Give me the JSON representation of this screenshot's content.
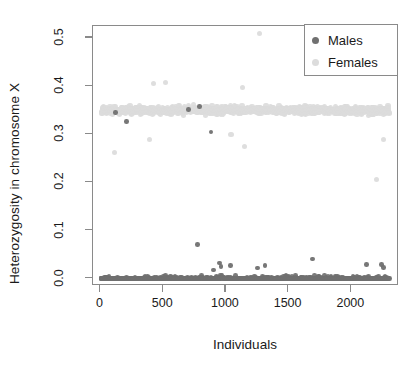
{
  "chart_data": {
    "type": "scatter",
    "title": "",
    "xlabel": "Individuals",
    "ylabel": "Heterozygosity in chromosome X",
    "xlim": [
      -60,
      2380
    ],
    "ylim": [
      -0.015,
      0.525
    ],
    "xticks": [
      0,
      500,
      1000,
      1500,
      2000
    ],
    "xticklabels": [
      "0",
      "500",
      "1000",
      "1500",
      "2000"
    ],
    "yticks": [
      0.0,
      0.1,
      0.2,
      0.3,
      0.4,
      0.5
    ],
    "yticklabels": [
      "0.0",
      "0.1",
      "0.2",
      "0.3",
      "0.4",
      "0.5"
    ],
    "grid": false,
    "legend_position": "top-right",
    "series": [
      {
        "name": "Males",
        "color": "#707070",
        "marker": "circle",
        "marker_size": 4.6,
        "description": "Dense band of ~1150 points hugging y=0.00-0.01 across all individuals, with scattered outliers up to 0.07 and a handful of points inside the female band near 0.30-0.35",
        "n_points": 1150,
        "y_band": [
          0.0,
          0.012
        ],
        "outliers": [
          {
            "x": 205,
            "y": 0.327
          },
          {
            "x": 120,
            "y": 0.345
          },
          {
            "x": 700,
            "y": 0.352
          },
          {
            "x": 790,
            "y": 0.358
          },
          {
            "x": 880,
            "y": 0.305
          },
          {
            "x": 775,
            "y": 0.071
          },
          {
            "x": 950,
            "y": 0.033
          },
          {
            "x": 960,
            "y": 0.025
          },
          {
            "x": 1035,
            "y": 0.028
          },
          {
            "x": 900,
            "y": 0.018
          },
          {
            "x": 1250,
            "y": 0.022
          },
          {
            "x": 1310,
            "y": 0.028
          },
          {
            "x": 1690,
            "y": 0.041
          },
          {
            "x": 2120,
            "y": 0.03
          },
          {
            "x": 2240,
            "y": 0.03
          },
          {
            "x": 2255,
            "y": 0.023
          }
        ]
      },
      {
        "name": "Females",
        "color": "#dcdcdc",
        "marker": "circle",
        "marker_size": 5.2,
        "description": "Dense horizontal band of ~1150 points centred on y=0.35 spanning roughly 0.31-0.39 across all individuals, with low outliers near 0.21-0.29 and one high outlier at 0.51",
        "n_points": 1150,
        "y_band": [
          0.312,
          0.388
        ],
        "y_center": 0.35,
        "outliers": [
          {
            "x": 1270,
            "y": 0.51
          },
          {
            "x": 420,
            "y": 0.405
          },
          {
            "x": 520,
            "y": 0.408
          },
          {
            "x": 1130,
            "y": 0.398
          },
          {
            "x": 110,
            "y": 0.262
          },
          {
            "x": 390,
            "y": 0.29
          },
          {
            "x": 1150,
            "y": 0.275
          },
          {
            "x": 2255,
            "y": 0.29
          },
          {
            "x": 2200,
            "y": 0.207
          },
          {
            "x": 1040,
            "y": 0.3
          }
        ]
      }
    ]
  },
  "legend": {
    "entries": [
      {
        "label": "Males",
        "color": "#707070"
      },
      {
        "label": "Females",
        "color": "#dcdcdc"
      }
    ]
  },
  "axes": {
    "x_title": "Individuals",
    "y_title": "Heterozygosity in chromosome X"
  }
}
